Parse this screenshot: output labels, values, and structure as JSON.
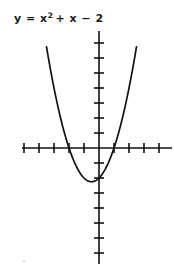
{
  "figure": {
    "title_parts": {
      "lhs": "y = x",
      "exponent": "2",
      "rhs": "+ x − 2"
    },
    "background_color": "#ffffff",
    "ink_color": "#111111",
    "title_color": "#1a1a1a"
  },
  "chart_data": {
    "type": "line",
    "xlabel": "",
    "ylabel": "",
    "equation": "y = x^2 + x - 2",
    "xlim": [
      -5.2,
      5.0
    ],
    "ylim": [
      -8.0,
      7.8
    ],
    "grid": false,
    "legend": "none",
    "axes": {
      "x_axis_visible": true,
      "y_axis_visible": true,
      "origin_label": "",
      "tick_spacing_units": 1,
      "tick_labels_shown": false,
      "x_ticks": [
        -5,
        -4,
        -3,
        -2,
        -1,
        1,
        2,
        3,
        4
      ],
      "y_ticks": [
        -7,
        -6,
        -5,
        -4,
        -3,
        -2,
        -1,
        1,
        2,
        3,
        4,
        5,
        6,
        7
      ]
    },
    "curve": {
      "name": "y = x² + x − 2",
      "roots": [
        -2,
        1
      ],
      "vertex": [
        -0.5,
        -2.25
      ],
      "y_intercept": -2,
      "opens": "up",
      "x": [
        -3.5,
        -3.0,
        -2.5,
        -2.0,
        -1.5,
        -1.0,
        -0.5,
        0.0,
        0.5,
        1.0,
        1.5,
        2.0,
        2.5
      ],
      "y": [
        6.75,
        4.0,
        1.75,
        0.0,
        -1.25,
        -2.0,
        -2.25,
        -2.0,
        -1.25,
        0.0,
        1.75,
        4.0,
        6.75
      ]
    }
  }
}
